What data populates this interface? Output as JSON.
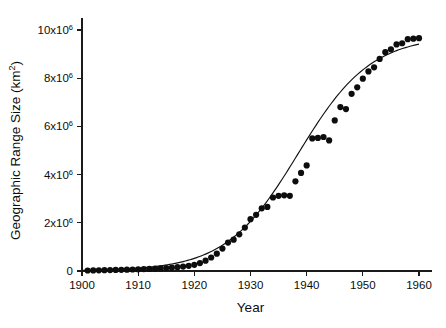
{
  "chart_data": {
    "type": "scatter",
    "title": "",
    "xlabel": "Year",
    "ylabel": "Geographic Range Size (km²)",
    "ylabel_base": "Geographic Range Size (km",
    "ylabel_sup": "2",
    "ylabel_tail": ")",
    "xlim": [
      1900,
      1962
    ],
    "ylim": [
      0,
      10600000
    ],
    "grid": false,
    "legend": false,
    "xticks": [
      1900,
      1910,
      1920,
      1930,
      1940,
      1950,
      1960
    ],
    "xtick_labels": [
      "1900",
      "1910",
      "1920",
      "1930",
      "1940",
      "1950",
      "1960"
    ],
    "yticks": [
      0,
      2000000,
      4000000,
      6000000,
      8000000,
      10000000
    ],
    "ytick_labels": [
      "0",
      "2x10",
      "4x10",
      "6x10",
      "8x10",
      "10x10"
    ],
    "ytick_exponents": [
      "",
      "6",
      "6",
      "6",
      "6",
      "6"
    ],
    "marker": "filled-circle",
    "marker_color": "#0d0d0d",
    "marker_size_px": 6.2,
    "curve_color": "#111111",
    "series": [
      {
        "name": "Geographic range size",
        "x": [
          1901,
          1902,
          1903,
          1904,
          1905,
          1906,
          1907,
          1908,
          1909,
          1910,
          1911,
          1912,
          1913,
          1914,
          1915,
          1916,
          1917,
          1918,
          1919,
          1920,
          1921,
          1922,
          1923,
          1924,
          1925,
          1926,
          1927,
          1928,
          1929,
          1930,
          1931,
          1932,
          1933,
          1934,
          1935,
          1936,
          1937,
          1938,
          1939,
          1940,
          1941,
          1942,
          1943,
          1944,
          1945,
          1946,
          1947,
          1948,
          1949,
          1950,
          1951,
          1952,
          1953,
          1954,
          1955,
          1956,
          1957,
          1958,
          1959,
          1960
        ],
        "y": [
          20000,
          25000,
          30000,
          35000,
          40000,
          45000,
          50000,
          55000,
          62000,
          70000,
          78000,
          88000,
          98000,
          110000,
          125000,
          140000,
          160000,
          185000,
          215000,
          255000,
          330000,
          430000,
          560000,
          720000,
          930000,
          1180000,
          1300000,
          1520000,
          1800000,
          2150000,
          2330000,
          2600000,
          2660000,
          3050000,
          3120000,
          3140000,
          3120000,
          3720000,
          4070000,
          4380000,
          5500000,
          5520000,
          5560000,
          5420000,
          6250000,
          6800000,
          6720000,
          7350000,
          7620000,
          7980000,
          8280000,
          8450000,
          8800000,
          9080000,
          9200000,
          9400000,
          9450000,
          9620000,
          9640000,
          9660000
        ]
      }
    ],
    "fit": {
      "name": "logistic fit",
      "model": "logistic",
      "asymptote": 9750000,
      "midpoint_year": 1938.5,
      "growth_rate": 0.155
    }
  }
}
